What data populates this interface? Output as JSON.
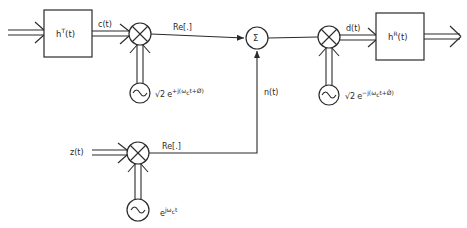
{
  "diagram": {
    "type": "block-diagram",
    "blocks": {
      "transmit_filter": {
        "label_base": "h",
        "label_sup": "T",
        "label_arg": "(t)"
      },
      "receive_filter": {
        "label_base": "h",
        "label_sup": "R",
        "label_arg": "(t)"
      },
      "summer": {
        "label": "Σ"
      }
    },
    "signals": {
      "c": "c(t)",
      "d": "d(t)",
      "n": "n(t)",
      "z": "z(t)"
    },
    "operators": {
      "re_top": "Re[.]",
      "re_bottom": "Re[.]"
    },
    "oscillators": {
      "modulator": {
        "coef": "√2",
        "base": "e",
        "exponent": "+j(ω",
        "sub": "c",
        "exponent_tail": "t+Ø)"
      },
      "demodulator": {
        "coef": "√2",
        "base": "e",
        "exponent": "−j(ω",
        "sub": "c",
        "exponent_tail": "t+Ø̂)"
      },
      "noise_carrier": {
        "coef": "",
        "base": "e",
        "exponent": "jω",
        "sub": "c",
        "exponent_tail": "t"
      }
    },
    "edges": [
      {
        "from": "input",
        "to": "transmit_filter",
        "kind": "complex"
      },
      {
        "from": "transmit_filter",
        "to": "mixer_1",
        "label": "c(t)",
        "kind": "complex"
      },
      {
        "from": "oscillator_modulator",
        "to": "mixer_1",
        "kind": "complex"
      },
      {
        "from": "mixer_1",
        "to": "summer",
        "label": "Re[.]",
        "kind": "real"
      },
      {
        "from": "z_input",
        "to": "mixer_3",
        "label": "z(t)",
        "kind": "complex"
      },
      {
        "from": "oscillator_noise",
        "to": "mixer_3",
        "kind": "complex"
      },
      {
        "from": "mixer_3",
        "to": "summer",
        "label": "Re[.] / n(t)",
        "kind": "real"
      },
      {
        "from": "summer",
        "to": "mixer_2",
        "kind": "real"
      },
      {
        "from": "oscillator_demodulator",
        "to": "mixer_2",
        "kind": "complex"
      },
      {
        "from": "mixer_2",
        "to": "receive_filter",
        "label": "d(t)",
        "kind": "complex"
      },
      {
        "from": "receive_filter",
        "to": "output",
        "kind": "complex"
      }
    ]
  }
}
